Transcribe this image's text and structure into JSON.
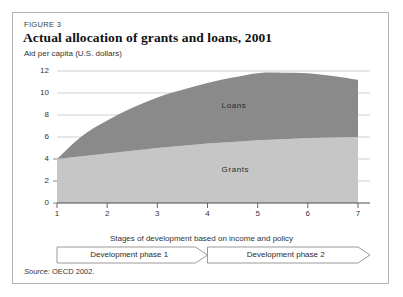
{
  "figure": {
    "number_label": "FIGURE 3",
    "title": "Actual allocation of grants and loans, 2001",
    "subtitle": "Aid per capita (U.S. dollars)",
    "source_word": "Source:",
    "source_text": "OECD 2002."
  },
  "phases": [
    {
      "label": "Development phase 1",
      "start": 1,
      "end": 4
    },
    {
      "label": "Development phase 2",
      "start": 4,
      "end": 7
    }
  ],
  "colors": {
    "loans_fill": "#8a8a8a",
    "grants_fill": "#c6c6c6",
    "gridline": "#cfcfcf",
    "axis": "#555555",
    "frame_border": "#b4b4b4",
    "phase_border": "#9a9a9a",
    "text": "#333333"
  },
  "chart_data": {
    "type": "area",
    "title": "Actual allocation of grants and loans, 2001",
    "subtitle": "Aid per capita (U.S. dollars)",
    "xlabel": "Stages of development based on income and policy",
    "ylabel": "Aid per capita (U.S. dollars)",
    "stacked": true,
    "grid": true,
    "legend_position": "inline-on-area",
    "xlim": [
      1,
      7
    ],
    "ylim": [
      0,
      12
    ],
    "xticks": [
      1,
      2,
      3,
      4,
      5,
      6,
      7
    ],
    "xtick_labels": [
      "1",
      "2",
      "3",
      "4",
      "5",
      "6",
      "7"
    ],
    "yticks": [
      0,
      2,
      4,
      6,
      8,
      10,
      12
    ],
    "ytick_labels": [
      "0",
      "2",
      "4",
      "6",
      "8",
      "10",
      "12"
    ],
    "x": [
      1,
      1.5,
      2,
      2.5,
      3,
      3.5,
      4,
      4.5,
      5,
      5.5,
      6,
      6.5,
      7
    ],
    "series": [
      {
        "name": "Grants",
        "fill": "#c6c6c6",
        "values": [
          4.0,
          4.25,
          4.5,
          4.75,
          5.0,
          5.2,
          5.4,
          5.55,
          5.7,
          5.8,
          5.9,
          5.95,
          6.0
        ]
      },
      {
        "name": "Loans",
        "fill": "#8a8a8a",
        "values": [
          0.0,
          1.85,
          3.0,
          3.9,
          4.6,
          5.1,
          5.5,
          5.85,
          6.1,
          6.05,
          5.9,
          5.6,
          5.2
        ]
      }
    ],
    "cumulative_top": [
      4.0,
      6.1,
      7.5,
      8.65,
      9.6,
      10.3,
      10.9,
      11.4,
      11.8,
      11.85,
      11.8,
      11.55,
      11.2
    ],
    "annotations": [
      {
        "text": "Loans",
        "x": 4.6,
        "y": 8.8
      },
      {
        "text": "Grants",
        "x": 4.6,
        "y": 3.0
      }
    ]
  }
}
